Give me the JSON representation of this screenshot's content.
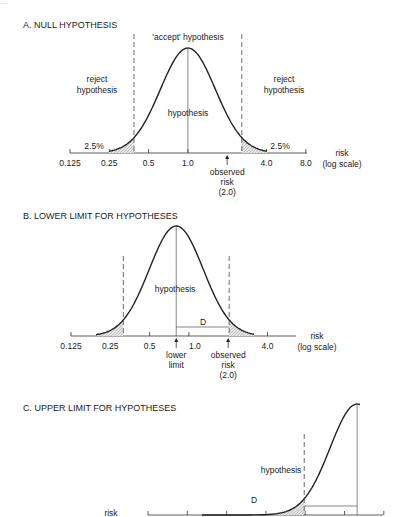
{
  "page_number_partial": "...",
  "panels": [
    {
      "id": "A",
      "title": "A. NULL  HYPOTHESIS",
      "top_label": "'accept' hypothesis",
      "left_region_label": [
        "reject",
        "hypothesis"
      ],
      "right_region_label": [
        "reject",
        "hypothesis"
      ],
      "center_label": "hypothesis",
      "left_tail_label": "2.5%",
      "right_tail_label": "2.5%",
      "axis_title": [
        "risk",
        "(log scale)"
      ],
      "tick_labels": [
        "0.125",
        "0.25",
        "0.5",
        "1.0",
        "4.0",
        "8.0"
      ],
      "tick_values": [
        0.125,
        0.25,
        0.5,
        1.0,
        4.0,
        8.0
      ],
      "curve_center_risk": 1.0,
      "arrows": [
        {
          "risk": 2.0,
          "label": [
            "observed",
            "risk",
            "(2.0)"
          ]
        }
      ]
    },
    {
      "id": "B",
      "title": "B. LOWER LIMIT FOR HYPOTHESES",
      "center_label": "hypothesis",
      "distance_label": "D",
      "axis_title": [
        "risk",
        "(log scale)"
      ],
      "tick_labels": [
        "0.125",
        "0.25",
        "0.5",
        "1.0",
        "4.0"
      ],
      "tick_values": [
        0.125,
        0.25,
        0.5,
        1.0,
        4.0
      ],
      "curve_center_risk": 0.8,
      "arrows": [
        {
          "risk": 0.8,
          "label": [
            "lower",
            "limit"
          ]
        },
        {
          "risk": 2.0,
          "label": [
            "observed",
            "risk",
            "(2.0)"
          ]
        }
      ]
    },
    {
      "id": "C",
      "title": "C. UPPER LIMIT FOR HYPOTHESES",
      "center_label": "hypothesis",
      "distance_label": "D",
      "axis_title": [
        "risk"
      ],
      "tick_values": [
        0.125,
        0.25,
        0.5,
        1.0,
        2.0,
        4.0,
        8.0
      ],
      "curve_center_risk": 5.0
    }
  ]
}
